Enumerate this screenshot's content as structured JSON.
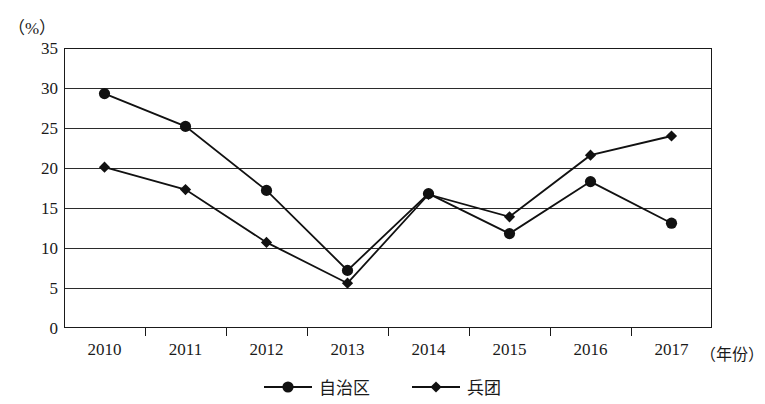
{
  "chart_data": {
    "type": "line",
    "title": "",
    "subtitle": "",
    "xlabel": "（年份）",
    "ylabel": "（%）",
    "x": [
      "2010",
      "2011",
      "2012",
      "2013",
      "2014",
      "2015",
      "2016",
      "2017"
    ],
    "categories": [
      "2010",
      "2011",
      "2012",
      "2013",
      "2014",
      "2015",
      "2016",
      "2017"
    ],
    "ylim": [
      0,
      35
    ],
    "ytick_values": [
      0,
      5,
      10,
      15,
      20,
      25,
      30,
      35
    ],
    "ytick_labels": [
      "0",
      "5",
      "10",
      "15",
      "20",
      "25",
      "30",
      "35"
    ],
    "grid": true,
    "grid_axis": "y",
    "legend_position": "bottom-center",
    "series": [
      {
        "name": "自治区",
        "marker": "circle",
        "color": "#111111",
        "values": [
          29.3,
          25.2,
          17.2,
          7.2,
          16.8,
          11.8,
          18.3,
          13.1
        ]
      },
      {
        "name": "兵团",
        "marker": "diamond",
        "color": "#111111",
        "values": [
          20.1,
          17.3,
          10.7,
          5.6,
          16.7,
          13.9,
          21.6,
          24.0
        ]
      }
    ]
  },
  "legend": {
    "items": [
      {
        "label": "自治区",
        "marker": "circle"
      },
      {
        "label": "兵团",
        "marker": "diamond"
      }
    ]
  },
  "axis": {
    "y_unit": "（%）",
    "x_title": "（年份）"
  },
  "colors": {
    "line": "#111111",
    "grid": "#2b2b2b",
    "frame": "#1a1a1a",
    "background": "#ffffff",
    "text": "#1a1a1a"
  }
}
